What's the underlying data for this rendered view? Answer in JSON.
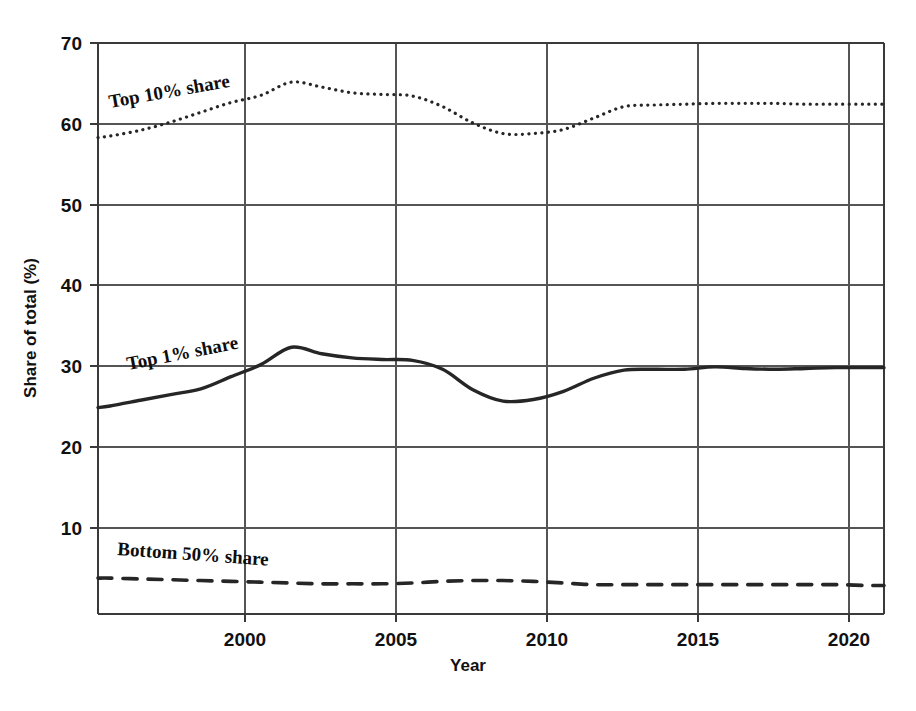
{
  "chart_data": {
    "type": "line",
    "title": "",
    "xlabel": "Year",
    "ylabel": "Share of total (%)",
    "xlim": [
      1995.6,
      2021.6
    ],
    "ylim": [
      0,
      70
    ],
    "xticks": [
      2000,
      2005,
      2010,
      2015,
      2020
    ],
    "xtick_labels": [
      "2000",
      "2005",
      "2010",
      "2015",
      "2020"
    ],
    "yticks": [
      10,
      20,
      30,
      40,
      50,
      60,
      70
    ],
    "ytick_labels": [
      "10",
      "20",
      "30",
      "40",
      "50",
      "60",
      "70"
    ],
    "grid": true,
    "legend": "inline-labels",
    "x": [
      1995.6,
      1996,
      1997,
      1998,
      1999,
      2000,
      2001,
      2002,
      2003,
      2004,
      2005,
      2006,
      2007,
      2008,
      2009,
      2010,
      2011,
      2012,
      2013,
      2014,
      2015,
      2016,
      2017,
      2018,
      2019,
      2020,
      2021,
      2021.6
    ],
    "series": [
      {
        "name": "Top 10% share",
        "label": "Top 10% share",
        "style": "dotted",
        "values": [
          58.4,
          58.6,
          59.3,
          60.3,
          61.5,
          62.7,
          63.6,
          65.2,
          64.6,
          63.9,
          63.7,
          63.5,
          62.2,
          60.2,
          58.9,
          58.9,
          59.4,
          60.8,
          62.2,
          62.4,
          62.5,
          62.6,
          62.6,
          62.6,
          62.5,
          62.5,
          62.5,
          62.5
        ]
      },
      {
        "name": "Top 1% share",
        "label": "Top 1% share",
        "style": "solid",
        "values": [
          25.3,
          25.5,
          26.2,
          26.9,
          27.6,
          29.1,
          30.6,
          32.7,
          31.9,
          31.4,
          31.2,
          31.1,
          30.0,
          27.5,
          26.1,
          26.3,
          27.3,
          28.9,
          29.9,
          30.0,
          30.0,
          30.3,
          30.1,
          30.0,
          30.1,
          30.2,
          30.2,
          30.2
        ]
      },
      {
        "name": "Bottom 50% share",
        "label": "Bottom 50% share",
        "style": "dashed",
        "values": [
          4.4,
          4.4,
          4.3,
          4.2,
          4.1,
          4.0,
          3.9,
          3.8,
          3.7,
          3.7,
          3.7,
          3.8,
          4.0,
          4.1,
          4.1,
          4.0,
          3.8,
          3.6,
          3.6,
          3.6,
          3.6,
          3.6,
          3.6,
          3.6,
          3.6,
          3.6,
          3.5,
          3.5
        ]
      }
    ]
  },
  "axes": {
    "ylabel": "Share of total (%)",
    "xlabel": "Year"
  },
  "ticks": {
    "y": [
      "70",
      "60",
      "50",
      "40",
      "30",
      "20",
      "10"
    ],
    "x": [
      "2000",
      "2005",
      "2010",
      "2015",
      "2020"
    ]
  },
  "labels": {
    "top10": "Top 10% share",
    "top1": "Top 1% share",
    "bottom50": "Bottom 50% share"
  },
  "colors": {
    "line": "#262626",
    "grid": "#555555",
    "frame": "#3a3a3a",
    "text": "#111111",
    "background": "#ffffff"
  }
}
